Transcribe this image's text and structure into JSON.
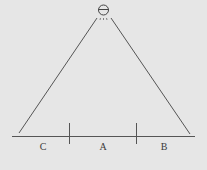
{
  "diagram": {
    "viewer": {
      "icon": "eye-viewer-icon"
    },
    "regions": [
      {
        "label": "C"
      },
      {
        "label": "A"
      },
      {
        "label": "B"
      }
    ],
    "colors": {
      "background": "#e6e6e6",
      "line": "#555555",
      "text": "#3a3a3a"
    }
  }
}
